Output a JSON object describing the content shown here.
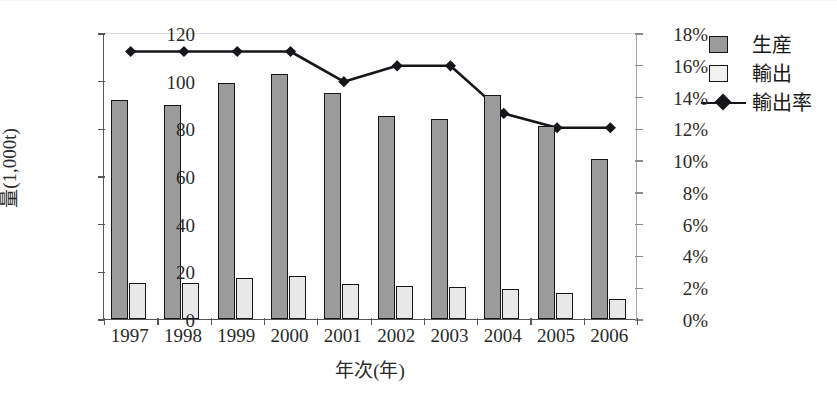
{
  "chart_data": {
    "type": "bar",
    "title": "",
    "xlabel": "年次(年)",
    "ylabel": "量(1,000t)",
    "y2label": "",
    "categories": [
      "1997",
      "1998",
      "1999",
      "2000",
      "2001",
      "2002",
      "2003",
      "2004",
      "2005",
      "2006"
    ],
    "ylim": [
      0,
      120
    ],
    "yticks": [
      0,
      20,
      40,
      60,
      80,
      100,
      120
    ],
    "ytick_labels": [
      "0",
      "20",
      "40",
      "60",
      "80",
      "100",
      "120"
    ],
    "y2lim": [
      0,
      18
    ],
    "y2ticks": [
      0,
      2,
      4,
      6,
      8,
      10,
      12,
      14,
      16,
      18
    ],
    "y2tick_labels": [
      "0%",
      "2%",
      "4%",
      "6%",
      "8%",
      "10%",
      "12%",
      "14%",
      "16%",
      "18%"
    ],
    "grid": false,
    "legend_position": "right",
    "series": [
      {
        "name": "生産",
        "type": "bar",
        "axis": "left",
        "color": "#9b9b9b",
        "values": [
          92,
          90,
          99,
          103,
          95,
          85,
          84,
          94,
          81,
          67
        ]
      },
      {
        "name": "輸出",
        "type": "bar",
        "axis": "left",
        "color": "#e8e8e8",
        "values": [
          15,
          15,
          17,
          18,
          14.5,
          14,
          13.5,
          12.5,
          11,
          8.5
        ]
      },
      {
        "name": "輸出率",
        "type": "line",
        "axis": "right",
        "color": "#15151a",
        "marker": "diamond",
        "values": [
          16.9,
          16.9,
          16.9,
          16.9,
          15.0,
          16.0,
          16.0,
          13.0,
          12.1,
          12.1
        ]
      }
    ]
  },
  "legend": {
    "items": [
      {
        "label": "生産",
        "key": "swatch-filled"
      },
      {
        "label": "輸出",
        "key": "swatch-empty"
      },
      {
        "label": "輸出率",
        "key": "line-diamond"
      }
    ]
  }
}
